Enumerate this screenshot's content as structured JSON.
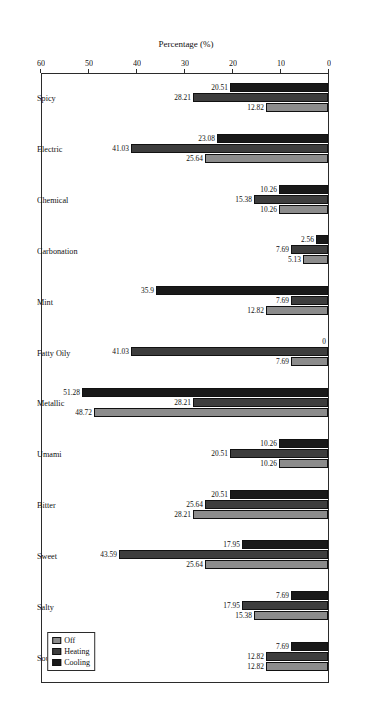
{
  "chart_data": {
    "type": "bar",
    "orientation": "horizontal",
    "title": "",
    "xlabel": "Percentage (%)",
    "ylabel": "",
    "xlim": [
      0,
      60
    ],
    "xticks": [
      0,
      10,
      20,
      30,
      40,
      50,
      60
    ],
    "grid": false,
    "legend_position": "top-left",
    "rotated_180": true,
    "categories": [
      "Sour",
      "Salty",
      "Sweet",
      "Bitter",
      "Umami",
      "Metallic",
      "Fatty Oily",
      "Mint",
      "Carbonation",
      "Chemical",
      "Electric",
      "Spicy"
    ],
    "series": [
      {
        "name": "Off",
        "color": "#8c8c8c",
        "values": [
          12.82,
          15.38,
          25.64,
          28.21,
          10.26,
          48.72,
          7.69,
          12.82,
          5.13,
          10.26,
          25.64,
          12.82
        ],
        "labels": [
          "12.82",
          "15.38",
          "25.64",
          "28.21",
          "10.26",
          "48.72",
          "7.69",
          "12.82",
          "5.13",
          "10.26",
          "25.64",
          "12.82"
        ]
      },
      {
        "name": "Heating",
        "color": "#3d3d3d",
        "values": [
          12.82,
          17.95,
          43.59,
          25.64,
          20.51,
          28.21,
          41.03,
          7.69,
          7.69,
          15.38,
          41.03,
          28.21
        ],
        "labels": [
          "12.82",
          "17.95",
          "43.59",
          "25.64",
          "20.51",
          "28.21",
          "41.03",
          "7.69",
          "7.69",
          "15.38",
          "41.03",
          "28.21"
        ]
      },
      {
        "name": "Cooling",
        "color": "#191919",
        "values": [
          7.69,
          7.69,
          17.95,
          20.51,
          10.26,
          51.28,
          0,
          35.9,
          2.56,
          10.26,
          23.08,
          20.51
        ],
        "labels": [
          "7.69",
          "7.69",
          "17.95",
          "20.51",
          "10.26",
          "51.28",
          "0",
          "35.9",
          "2.56",
          "10.26",
          "23.08",
          "20.51"
        ]
      }
    ]
  },
  "axis": {
    "x_title": "Percentage (%)",
    "tick_labels": [
      "0",
      "10",
      "20",
      "30",
      "40",
      "50",
      "60"
    ]
  },
  "legend": {
    "items": [
      {
        "label": "Off",
        "color": "#8c8c8c"
      },
      {
        "label": "Heating",
        "color": "#3d3d3d"
      },
      {
        "label": "Cooling",
        "color": "#191919"
      }
    ]
  }
}
